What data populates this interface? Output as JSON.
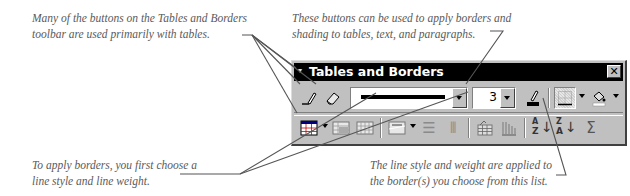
{
  "annotations": {
    "top_left": {
      "lines": [
        "Many of the buttons on the Tables and Borders",
        "toolbar are used primarily with tables."
      ]
    },
    "top_right": {
      "lines": [
        "These buttons can be used to apply borders and",
        "shading to tables, text, and paragraphs."
      ]
    },
    "bottom_left": {
      "lines": [
        "To apply borders, you first choose a",
        "line style and line weight."
      ]
    },
    "bottom_right": {
      "lines": [
        "The line style and weight are applied to",
        "the border(s) you choose from this list."
      ]
    }
  },
  "toolbar": {
    "title": "Tables and Borders",
    "menu_glyph": "▾",
    "close_glyph": "✕",
    "row1": {
      "draw_table": {
        "icon": "pencil-icon",
        "glyph": "✎"
      },
      "eraser": {
        "icon": "eraser-icon",
        "glyph": "⌫"
      },
      "line_style": {
        "value": "solid"
      },
      "line_weight": {
        "value": "3"
      },
      "border_color": {
        "icon": "pen-color-icon",
        "glyph": "✎"
      },
      "borders": {
        "icon": "borders-icon"
      },
      "shading_color": {
        "icon": "paint-bucket-icon",
        "glyph": "♨"
      }
    },
    "row2": {
      "insert_table": {
        "icon": "table-grid-icon"
      },
      "merge_cells": {
        "icon": "merge-cells-icon"
      },
      "split_cells": {
        "icon": "split-cells-icon"
      },
      "align": {
        "icon": "align-top-icon"
      },
      "distribute_rows": {
        "icon": "distribute-rows-icon",
        "glyph": "☰"
      },
      "distribute_columns": {
        "icon": "distribute-columns-icon",
        "glyph": "⫴"
      },
      "autoformat": {
        "icon": "table-autoformat-icon"
      },
      "change_text_direction": {
        "icon": "text-direction-icon"
      },
      "sort_ascending": {
        "icon": "sort-ascending-icon",
        "glyph_top": "A",
        "glyph_bottom": "Z"
      },
      "sort_descending": {
        "icon": "sort-descending-icon",
        "glyph_top": "Z",
        "glyph_bottom": "A"
      },
      "autosum": {
        "icon": "autosum-icon",
        "glyph": "Σ"
      }
    }
  },
  "colors": {
    "toolbar_face": "#c0c0c0",
    "titlebar": "#000000",
    "annotation_text": "#5a5a5a",
    "callout_line": "#555555"
  }
}
